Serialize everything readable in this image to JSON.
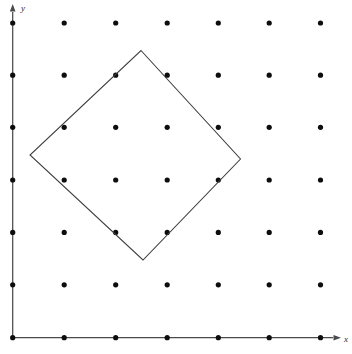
{
  "figure": {
    "background_color": "#ffffff",
    "width": 352,
    "height": 354
  },
  "axes": {
    "x_axis": {
      "label": "x",
      "label_x": 344,
      "label_y": 342,
      "line": {
        "x1": 12.7,
        "y1": 337.7,
        "x2": 333,
        "y2": 337.7
      },
      "arrow_tip": {
        "x": 341,
        "y": 337.7
      },
      "color": "#4a4a4a"
    },
    "y_axis": {
      "label": "y",
      "label_x": 21,
      "label_y": 11,
      "line": {
        "x1": 12.7,
        "y1": 337.7,
        "x2": 12.7,
        "y2": 12
      },
      "arrow_tip": {
        "x": 12.7,
        "y": 4
      },
      "color": "#4a4a4a"
    }
  },
  "chart_data": {
    "type": "scatter",
    "title": "",
    "xlabel": "x",
    "ylabel": "y",
    "grid": false,
    "legend": null,
    "lattice": {
      "rows": 7,
      "cols": 7,
      "dot_color": "#0d0d0d",
      "dot_radius": 2.6,
      "x_positions": [
        12.7,
        64.2,
        115.7,
        167.2,
        218.3,
        269.2,
        320.5
      ],
      "y_positions": [
        23.0,
        75.2,
        127.3,
        180.0,
        232.4,
        284.8,
        337.7
      ],
      "points": [
        [
          0,
          6
        ],
        [
          1,
          6
        ],
        [
          2,
          6
        ],
        [
          3,
          6
        ],
        [
          4,
          6
        ],
        [
          5,
          6
        ],
        [
          6,
          6
        ],
        [
          0,
          5
        ],
        [
          1,
          5
        ],
        [
          2,
          5
        ],
        [
          3,
          5
        ],
        [
          4,
          5
        ],
        [
          5,
          5
        ],
        [
          6,
          5
        ],
        [
          0,
          4
        ],
        [
          1,
          4
        ],
        [
          2,
          4
        ],
        [
          3,
          4
        ],
        [
          4,
          4
        ],
        [
          5,
          4
        ],
        [
          6,
          4
        ],
        [
          0,
          3
        ],
        [
          1,
          3
        ],
        [
          2,
          3
        ],
        [
          3,
          3
        ],
        [
          4,
          3
        ],
        [
          5,
          3
        ],
        [
          6,
          3
        ],
        [
          0,
          2
        ],
        [
          1,
          2
        ],
        [
          2,
          2
        ],
        [
          3,
          2
        ],
        [
          4,
          2
        ],
        [
          5,
          2
        ],
        [
          6,
          2
        ],
        [
          0,
          1
        ],
        [
          1,
          1
        ],
        [
          2,
          1
        ],
        [
          3,
          1
        ],
        [
          4,
          1
        ],
        [
          5,
          1
        ],
        [
          6,
          1
        ],
        [
          0,
          0
        ],
        [
          1,
          0
        ],
        [
          2,
          0
        ],
        [
          3,
          0
        ],
        [
          4,
          0
        ],
        [
          5,
          0
        ],
        [
          6,
          0
        ]
      ]
    },
    "shapes": [
      {
        "name": "tilted-square",
        "type": "polygon",
        "stroke_color": "#3c3c3c",
        "fill": "none",
        "vertices": [
          {
            "x": 141.0,
            "y": 50.5
          },
          {
            "x": 240.5,
            "y": 159.0
          },
          {
            "x": 143.0,
            "y": 260.0
          },
          {
            "x": 30.0,
            "y": 155.0
          }
        ],
        "vertices_path": "141,50.5 240.5,159 143,260 30,155"
      }
    ]
  }
}
